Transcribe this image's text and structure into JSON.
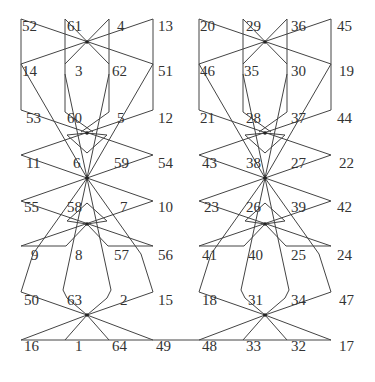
{
  "diagram": {
    "title": "",
    "line_color": "#444444",
    "text_color": "#333333",
    "hub_color": "#222222",
    "labels": [
      {
        "text": "52",
        "x": 22,
        "y": 26
      },
      {
        "text": "61",
        "x": 67,
        "y": 26
      },
      {
        "text": "4",
        "x": 117,
        "y": 26
      },
      {
        "text": "13",
        "x": 158,
        "y": 26
      },
      {
        "text": "14",
        "x": 22,
        "y": 71
      },
      {
        "text": "3",
        "x": 75,
        "y": 71
      },
      {
        "text": "62",
        "x": 112,
        "y": 71
      },
      {
        "text": "51",
        "x": 158,
        "y": 71
      },
      {
        "text": "53",
        "x": 26,
        "y": 118
      },
      {
        "text": "60",
        "x": 67,
        "y": 118
      },
      {
        "text": "5",
        "x": 117,
        "y": 118
      },
      {
        "text": "12",
        "x": 158,
        "y": 118
      },
      {
        "text": "11",
        "x": 26,
        "y": 163
      },
      {
        "text": "6",
        "x": 73,
        "y": 163
      },
      {
        "text": "59",
        "x": 114,
        "y": 163
      },
      {
        "text": "54",
        "x": 158,
        "y": 163
      },
      {
        "text": "55",
        "x": 24,
        "y": 207
      },
      {
        "text": "58",
        "x": 67,
        "y": 207
      },
      {
        "text": "7",
        "x": 120,
        "y": 207
      },
      {
        "text": "10",
        "x": 158,
        "y": 207
      },
      {
        "text": "9",
        "x": 31,
        "y": 255
      },
      {
        "text": "8",
        "x": 75,
        "y": 255
      },
      {
        "text": "57",
        "x": 114,
        "y": 255
      },
      {
        "text": "56",
        "x": 158,
        "y": 255
      },
      {
        "text": "50",
        "x": 24,
        "y": 300
      },
      {
        "text": "63",
        "x": 67,
        "y": 300
      },
      {
        "text": "2",
        "x": 120,
        "y": 300
      },
      {
        "text": "15",
        "x": 158,
        "y": 300
      },
      {
        "text": "16",
        "x": 24,
        "y": 346
      },
      {
        "text": "1",
        "x": 75,
        "y": 346
      },
      {
        "text": "64",
        "x": 112,
        "y": 346
      },
      {
        "text": "49",
        "x": 156,
        "y": 346
      },
      {
        "text": "20",
        "x": 200,
        "y": 26
      },
      {
        "text": "29",
        "x": 246,
        "y": 26
      },
      {
        "text": "36",
        "x": 291,
        "y": 26
      },
      {
        "text": "45",
        "x": 337,
        "y": 26
      },
      {
        "text": "46",
        "x": 200,
        "y": 71
      },
      {
        "text": "35",
        "x": 244,
        "y": 71
      },
      {
        "text": "30",
        "x": 291,
        "y": 71
      },
      {
        "text": "19",
        "x": 339,
        "y": 71
      },
      {
        "text": "21",
        "x": 200,
        "y": 118
      },
      {
        "text": "28",
        "x": 246,
        "y": 118
      },
      {
        "text": "37",
        "x": 291,
        "y": 118
      },
      {
        "text": "44",
        "x": 337,
        "y": 118
      },
      {
        "text": "43",
        "x": 202,
        "y": 163
      },
      {
        "text": "38",
        "x": 246,
        "y": 163
      },
      {
        "text": "27",
        "x": 291,
        "y": 163
      },
      {
        "text": "22",
        "x": 339,
        "y": 163
      },
      {
        "text": "23",
        "x": 204,
        "y": 207
      },
      {
        "text": "26",
        "x": 246,
        "y": 207
      },
      {
        "text": "39",
        "x": 291,
        "y": 207
      },
      {
        "text": "42",
        "x": 337,
        "y": 207
      },
      {
        "text": "41",
        "x": 202,
        "y": 255
      },
      {
        "text": "40",
        "x": 248,
        "y": 255
      },
      {
        "text": "25",
        "x": 291,
        "y": 255
      },
      {
        "text": "24",
        "x": 337,
        "y": 255
      },
      {
        "text": "18",
        "x": 202,
        "y": 300
      },
      {
        "text": "31",
        "x": 248,
        "y": 300
      },
      {
        "text": "34",
        "x": 291,
        "y": 300
      },
      {
        "text": "47",
        "x": 339,
        "y": 300
      },
      {
        "text": "48",
        "x": 202,
        "y": 346
      },
      {
        "text": "33",
        "x": 246,
        "y": 346
      },
      {
        "text": "32",
        "x": 291,
        "y": 346
      },
      {
        "text": "17",
        "x": 339,
        "y": 346
      }
    ],
    "halves": [
      {
        "name": "left",
        "cols": [
          21,
          65,
          109,
          153
        ],
        "hub_x": 87
      },
      {
        "name": "right",
        "cols": [
          199,
          243,
          287,
          331
        ],
        "hub_x": 265
      }
    ],
    "rows": [
      19,
      64,
      110,
      155,
      201,
      246,
      292,
      340
    ],
    "hubs_y": [
      42,
      133,
      178,
      224,
      315
    ],
    "bottom_line": {
      "x1": 21,
      "x2": 331,
      "y": 340
    }
  }
}
